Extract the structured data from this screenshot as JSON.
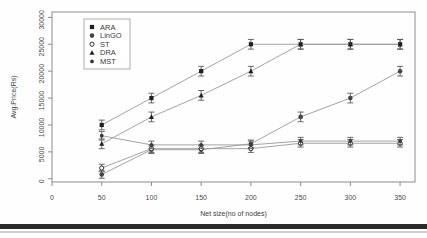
{
  "chart_data": {
    "type": "line",
    "title": "",
    "xlabel": "Net size(no of nodes)",
    "ylabel": "Avg.Price(Rs)",
    "xlim": [
      0,
      365
    ],
    "ylim": [
      -600,
      31000
    ],
    "xticks": [
      0,
      50,
      100,
      150,
      200,
      250,
      300,
      350
    ],
    "xticklabels": [
      "0",
      "50",
      "100",
      "150",
      "200",
      "250",
      "300",
      "350"
    ],
    "yticks": [
      0,
      5000,
      10000,
      15000,
      20000,
      25000,
      30000
    ],
    "yticklabels": [
      "0",
      "5000",
      "10000",
      "15000",
      "20000",
      "25000",
      "30000"
    ],
    "grid": false,
    "legend_position": "upper-left-inside",
    "error_bars": true,
    "x": [
      50,
      100,
      150,
      200,
      250,
      300,
      350
    ],
    "series": [
      {
        "name": "ARA",
        "marker": "square",
        "values": [
          10000,
          15000,
          20000,
          25000,
          25000,
          25000,
          25000
        ],
        "errors": [
          900,
          900,
          900,
          900,
          900,
          900,
          900
        ]
      },
      {
        "name": "LinGO",
        "marker": "circle",
        "values": [
          800,
          5400,
          5400,
          6500,
          11500,
          15000,
          20000
        ],
        "errors": [
          700,
          700,
          700,
          700,
          900,
          900,
          900
        ]
      },
      {
        "name": "ST",
        "marker": "circle-open",
        "values": [
          2000,
          5600,
          5600,
          5600,
          6600,
          6600,
          6600
        ],
        "errors": [
          700,
          700,
          700,
          700,
          700,
          700,
          700
        ]
      },
      {
        "name": "DRA",
        "marker": "triangle",
        "values": [
          6500,
          11500,
          15500,
          20000,
          25000,
          25000,
          25000
        ],
        "errors": [
          900,
          900,
          900,
          900,
          900,
          900,
          900
        ]
      },
      {
        "name": "MST",
        "marker": "circle-small",
        "values": [
          8000,
          6300,
          6300,
          6300,
          7000,
          7000,
          7000
        ],
        "errors": [
          800,
          700,
          700,
          700,
          700,
          700,
          700
        ]
      }
    ]
  }
}
